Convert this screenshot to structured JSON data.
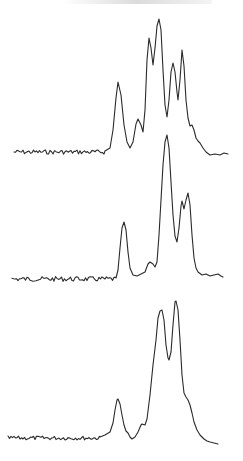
{
  "chart_data": {
    "type": "line",
    "title": "",
    "xlabel": "",
    "ylabel": "",
    "grid": false,
    "legend": null,
    "series": [
      {
        "name": "trace-top",
        "baseline": {
          "x_start": 14,
          "x_end": 105,
          "y": 152,
          "noise": 2.2
        },
        "points": [
          [
            105,
            151
          ],
          [
            110,
            148
          ],
          [
            113,
            130
          ],
          [
            116,
            98
          ],
          [
            118,
            82
          ],
          [
            121,
            95
          ],
          [
            124,
            125
          ],
          [
            127,
            142
          ],
          [
            130,
            148
          ],
          [
            133,
            142
          ],
          [
            136,
            124
          ],
          [
            138,
            119
          ],
          [
            141,
            125
          ],
          [
            143,
            132
          ],
          [
            145,
            110
          ],
          [
            147,
            60
          ],
          [
            149,
            38
          ],
          [
            151,
            48
          ],
          [
            153,
            65
          ],
          [
            155,
            48
          ],
          [
            157,
            26
          ],
          [
            159,
            19
          ],
          [
            161,
            30
          ],
          [
            163,
            70
          ],
          [
            165,
            105
          ],
          [
            167,
            117
          ],
          [
            169,
            100
          ],
          [
            171,
            72
          ],
          [
            173,
            63
          ],
          [
            175,
            72
          ],
          [
            177,
            92
          ],
          [
            178,
            100
          ],
          [
            180,
            80
          ],
          [
            182,
            50
          ],
          [
            184,
            66
          ],
          [
            186,
            100
          ],
          [
            188,
            118
          ],
          [
            190,
            126
          ],
          [
            192,
            125
          ],
          [
            194,
            130
          ],
          [
            196,
            138
          ],
          [
            198,
            141
          ],
          [
            200,
            143
          ],
          [
            203,
            148
          ],
          [
            206,
            152
          ],
          [
            210,
            155
          ],
          [
            215,
            154
          ],
          [
            220,
            155
          ],
          [
            224,
            153
          ],
          [
            228,
            154
          ]
        ]
      },
      {
        "name": "trace-middle",
        "baseline": {
          "x_start": 12,
          "x_end": 116,
          "y": 279,
          "noise": 2.4
        },
        "points": [
          [
            116,
            278
          ],
          [
            118,
            270
          ],
          [
            120,
            248
          ],
          [
            122,
            228
          ],
          [
            124,
            222
          ],
          [
            126,
            230
          ],
          [
            128,
            252
          ],
          [
            130,
            268
          ],
          [
            133,
            275
          ],
          [
            137,
            276
          ],
          [
            141,
            274
          ],
          [
            145,
            272
          ],
          [
            148,
            264
          ],
          [
            150,
            262
          ],
          [
            153,
            264
          ],
          [
            155,
            267
          ],
          [
            157,
            262
          ],
          [
            159,
            235
          ],
          [
            161,
            200
          ],
          [
            163,
            165
          ],
          [
            165,
            142
          ],
          [
            167,
            135
          ],
          [
            169,
            148
          ],
          [
            171,
            182
          ],
          [
            173,
            215
          ],
          [
            175,
            236
          ],
          [
            177,
            242
          ],
          [
            179,
            228
          ],
          [
            181,
            206
          ],
          [
            182,
            201
          ],
          [
            184,
            209
          ],
          [
            186,
            200
          ],
          [
            188,
            193
          ],
          [
            190,
            205
          ],
          [
            192,
            235
          ],
          [
            194,
            258
          ],
          [
            196,
            268
          ],
          [
            198,
            272
          ],
          [
            202,
            275
          ],
          [
            206,
            274
          ],
          [
            210,
            276
          ],
          [
            214,
            275
          ],
          [
            218,
            274
          ],
          [
            221,
            276
          ],
          [
            223,
            277
          ]
        ]
      },
      {
        "name": "trace-bottom",
        "baseline": {
          "x_start": 8,
          "x_end": 100,
          "y": 438,
          "noise": 2.0
        },
        "points": [
          [
            100,
            437
          ],
          [
            105,
            435
          ],
          [
            110,
            432
          ],
          [
            113,
            423
          ],
          [
            115,
            410
          ],
          [
            117,
            400
          ],
          [
            118,
            399
          ],
          [
            120,
            404
          ],
          [
            122,
            415
          ],
          [
            124,
            425
          ],
          [
            126,
            431
          ],
          [
            128,
            433
          ],
          [
            130,
            437
          ],
          [
            132,
            439
          ],
          [
            135,
            437
          ],
          [
            138,
            432
          ],
          [
            141,
            425
          ],
          [
            142,
            424
          ],
          [
            145,
            425
          ],
          [
            147,
            419
          ],
          [
            150,
            395
          ],
          [
            153,
            365
          ],
          [
            156,
            340
          ],
          [
            158,
            318
          ],
          [
            160,
            311
          ],
          [
            162,
            310
          ],
          [
            164,
            320
          ],
          [
            166,
            345
          ],
          [
            168,
            358
          ],
          [
            169,
            360
          ],
          [
            171,
            352
          ],
          [
            173,
            325
          ],
          [
            175,
            302
          ],
          [
            176,
            301
          ],
          [
            178,
            310
          ],
          [
            180,
            340
          ],
          [
            182,
            375
          ],
          [
            184,
            393
          ],
          [
            186,
            397
          ],
          [
            188,
            400
          ],
          [
            190,
            405
          ],
          [
            192,
            413
          ],
          [
            194,
            422
          ],
          [
            197,
            430
          ],
          [
            200,
            435
          ],
          [
            204,
            439
          ],
          [
            207,
            441
          ],
          [
            210,
            442
          ],
          [
            214,
            443
          ],
          [
            218,
            444
          ]
        ]
      }
    ]
  }
}
